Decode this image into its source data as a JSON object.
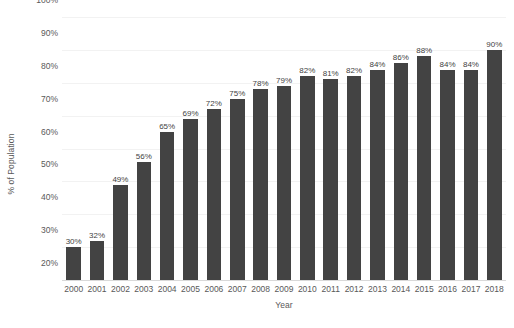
{
  "chart_data": {
    "type": "bar",
    "title": "",
    "xlabel": "Year",
    "ylabel": "% of Population",
    "categories": [
      "2000",
      "2001",
      "2002",
      "2003",
      "2004",
      "2005",
      "2006",
      "2007",
      "2008",
      "2009",
      "2010",
      "2011",
      "2012",
      "2013",
      "2014",
      "2015",
      "2016",
      "2017",
      "2018"
    ],
    "values": [
      30,
      32,
      49,
      56,
      65,
      69,
      72,
      75,
      78,
      79,
      82,
      81,
      82,
      84,
      86,
      88,
      84,
      84,
      90
    ],
    "data_labels": [
      "30%",
      "32%",
      "49%",
      "56%",
      "65%",
      "69%",
      "72%",
      "75%",
      "78%",
      "79%",
      "82%",
      "81%",
      "82%",
      "84%",
      "86%",
      "88%",
      "84%",
      "84%",
      "90%"
    ],
    "ylim": [
      20,
      100
    ],
    "ytick_values": [
      100,
      90,
      80,
      70,
      60,
      50,
      40,
      30,
      20
    ],
    "ytick_labels": [
      "100%",
      "90%",
      "80%",
      "70%",
      "60%",
      "50%",
      "40%",
      "30%",
      "20%"
    ],
    "grid": true,
    "legend": "none",
    "bar_color": "#434343",
    "gridline_color": "#f2f2f2",
    "text_color": "#595959",
    "background_color": "#ffffff"
  }
}
